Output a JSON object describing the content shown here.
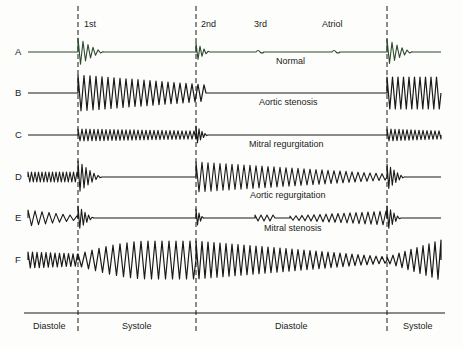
{
  "figure": {
    "markers": [
      {
        "label": "1st",
        "x": 84,
        "y": 24
      },
      {
        "label": "2nd",
        "x": 201,
        "y": 24
      },
      {
        "label": "3rd",
        "x": 255,
        "y": 24
      },
      {
        "label": "Atriol",
        "x": 323,
        "y": 24
      }
    ],
    "dashed_lines_x": [
      78,
      196,
      387
    ],
    "rows": [
      {
        "id": "A",
        "label": "A",
        "caption": "Normal",
        "baseline_y": 52,
        "caption_x": 276,
        "caption_y": 60
      },
      {
        "id": "B",
        "label": "B",
        "caption": "Aortic stenosis",
        "baseline_y": 93,
        "caption_x": 259,
        "caption_y": 101
      },
      {
        "id": "C",
        "label": "C",
        "caption": "Mitral regurgitation",
        "baseline_y": 135,
        "caption_x": 249,
        "caption_y": 143
      },
      {
        "id": "D",
        "label": "D",
        "caption": "Aortic regurgitation",
        "baseline_y": 177,
        "caption_x": 250,
        "caption_y": 194
      },
      {
        "id": "E",
        "label": "E",
        "caption": "Mitral stenosis",
        "baseline_y": 218,
        "caption_x": 264,
        "caption_y": 226
      },
      {
        "id": "F",
        "label": "F",
        "caption": "",
        "baseline_y": 260
      }
    ],
    "phases": [
      {
        "label": "Diastole",
        "x": 33
      },
      {
        "label": "Systole",
        "x": 122
      },
      {
        "label": "Diastole",
        "x": 275
      },
      {
        "label": "Systole",
        "x": 403
      }
    ],
    "colors": {
      "ink": "#1a1a1a",
      "background": "#fdfdfb",
      "normal_trace_tint": "#2d4a2d"
    }
  }
}
